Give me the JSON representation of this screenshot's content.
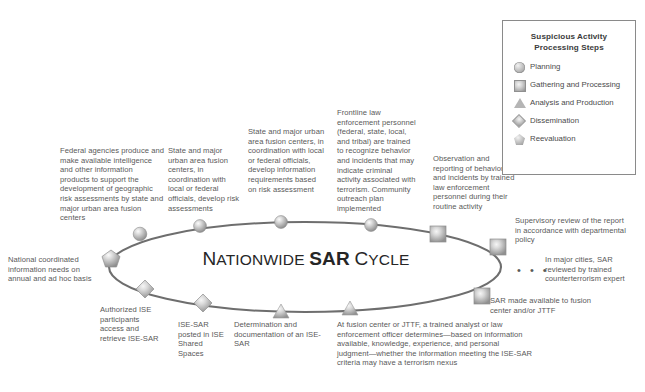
{
  "diagram": {
    "center_title_pre": "Nationwide",
    "center_title_bold": "SAR",
    "center_title_post": "Cycle",
    "ellipsis": "• • •"
  },
  "legend": {
    "title": "Suspicious Activity\nProcessing Steps",
    "title_line1": "Suspicious Activity",
    "title_line2": "Processing Steps",
    "items": [
      {
        "icon": "circle-marker-icon",
        "label": "Planning"
      },
      {
        "icon": "square-marker-icon",
        "label": "Gathering and Processing"
      },
      {
        "icon": "triangle-marker-icon",
        "label": "Analysis and Production"
      },
      {
        "icon": "diamond-marker-icon",
        "label": "Dissemination"
      },
      {
        "icon": "pentagon-marker-icon",
        "label": "Reevaluation"
      }
    ]
  },
  "callouts": {
    "federal_agencies": "Federal agencies produce and make available intelligence and other information products to support the development of geographic risk assessments by state and major urban area fusion centers",
    "national_needs": "National coordinated information needs on annual and ad hoc basis",
    "state_risk": "State and major urban area fusion centers, in coordination with local or federal officials, develop risk assessments",
    "state_info_req": "State and major urban area fusion centers, in coordination with local or federal officials, develop information requirements based on risk assessment",
    "frontline": "Frontline law enforcement personnel (federal, state, local, and tribal) are trained to recognize behavior and incidents that may indicate criminal activity associated with terrorism. Community outreach plan implemented",
    "observation": "Observation and reporting of behaviors and incidents by trained law enforcement personnel during their routine activity",
    "supervisory": "Supervisory review of the report in accordance with departmental policy",
    "major_cities": "In major cities, SAR reviewed by trained counterterrorism expert",
    "sar_available": "SAR made available to fusion center and/or JTTF",
    "at_fusion_center": "At fusion center or JTTF, a trained analyst or law enforcement officer determines—based on information available, knowledge, experience, and personal judgment—whether the information meeting the ISE-SAR criteria may have a terrorism nexus",
    "determination": "Determination and documentation of an ISE-SAR",
    "ise_sar_posted": "ISE-SAR posted in ISE Shared Spaces",
    "authorized_ise": "Authorized ISE participants access and retrieve ISE-SAR"
  },
  "markers": [
    {
      "type": "circle",
      "step": "Planning",
      "x": 140,
      "y": 234
    },
    {
      "type": "circle",
      "step": "Planning",
      "x": 200,
      "y": 226
    },
    {
      "type": "circle",
      "step": "Planning",
      "x": 281,
      "y": 222
    },
    {
      "type": "circle",
      "step": "Planning",
      "x": 371,
      "y": 225
    },
    {
      "type": "square",
      "step": "Gathering and Processing",
      "x": 438,
      "y": 234
    },
    {
      "type": "square",
      "step": "Gathering and Processing",
      "x": 498,
      "y": 247
    },
    {
      "type": "square",
      "step": "Gathering and Processing",
      "x": 482,
      "y": 296
    },
    {
      "type": "triangle",
      "step": "Analysis and Production",
      "x": 350,
      "y": 309
    },
    {
      "type": "triangle",
      "step": "Analysis and Production",
      "x": 281,
      "y": 312
    },
    {
      "type": "diamond",
      "step": "Dissemination",
      "x": 203,
      "y": 303
    },
    {
      "type": "diamond",
      "step": "Dissemination",
      "x": 145,
      "y": 289
    },
    {
      "type": "pentagon",
      "step": "Reevaluation",
      "x": 111,
      "y": 259
    }
  ],
  "colors": {
    "outline": "#6e6e6e",
    "text": "#595959",
    "title": "#262626"
  }
}
